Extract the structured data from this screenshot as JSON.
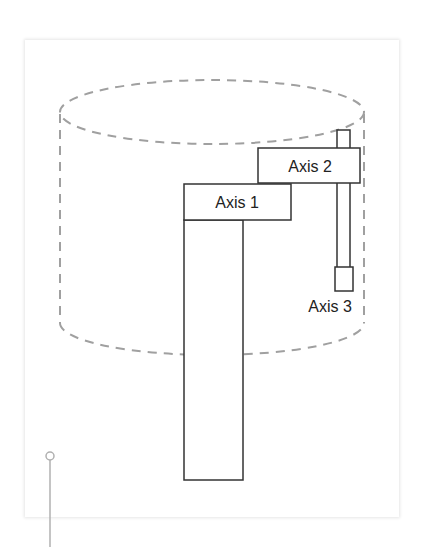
{
  "diagram": {
    "type": "scara-robot-workspace",
    "workspace": {
      "shape": "cylinder",
      "style": "dashed",
      "color": "#a0a0a0"
    },
    "labels": {
      "axis1": "Axis 1",
      "axis2": "Axis 2",
      "axis3": "Axis 3"
    },
    "colors": {
      "stroke": "#333333",
      "dashed": "#a0a0a0",
      "pin": "#b0b0b0"
    }
  }
}
